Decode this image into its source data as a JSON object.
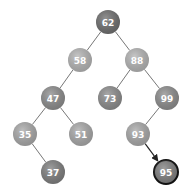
{
  "diagram": {
    "type": "binary-search-tree",
    "highlighted_path_target": "95",
    "nodes": [
      {
        "id": "62",
        "label": "62",
        "x": 108,
        "y": 22,
        "fill": "#6e6e6e"
      },
      {
        "id": "58",
        "label": "58",
        "x": 80,
        "y": 60,
        "fill": "#b4b4b4"
      },
      {
        "id": "88",
        "label": "88",
        "x": 137,
        "y": 60,
        "fill": "#b4b4b4"
      },
      {
        "id": "47",
        "label": "47",
        "x": 53,
        "y": 98,
        "fill": "#8c8c8c"
      },
      {
        "id": "73",
        "label": "73",
        "x": 110,
        "y": 98,
        "fill": "#8c8c8c"
      },
      {
        "id": "99",
        "label": "99",
        "x": 167,
        "y": 98,
        "fill": "#8c8c8c"
      },
      {
        "id": "35",
        "label": "35",
        "x": 25,
        "y": 134,
        "fill": "#a8a8a8"
      },
      {
        "id": "51",
        "label": "51",
        "x": 81,
        "y": 134,
        "fill": "#a8a8a8"
      },
      {
        "id": "93",
        "label": "93",
        "x": 138,
        "y": 134,
        "fill": "#a8a8a8"
      },
      {
        "id": "37",
        "label": "37",
        "x": 53,
        "y": 172,
        "fill": "#7e7e7e"
      },
      {
        "id": "95",
        "label": "95",
        "x": 166,
        "y": 172,
        "fill": "#7e7e7e",
        "highlighted": true
      }
    ],
    "edges": [
      {
        "from": "62",
        "to": "58"
      },
      {
        "from": "62",
        "to": "88"
      },
      {
        "from": "58",
        "to": "47"
      },
      {
        "from": "88",
        "to": "73"
      },
      {
        "from": "88",
        "to": "99"
      },
      {
        "from": "47",
        "to": "35"
      },
      {
        "from": "47",
        "to": "51"
      },
      {
        "from": "99",
        "to": "93"
      },
      {
        "from": "35",
        "to": "37"
      },
      {
        "from": "93",
        "to": "95",
        "arrow": true
      }
    ]
  }
}
